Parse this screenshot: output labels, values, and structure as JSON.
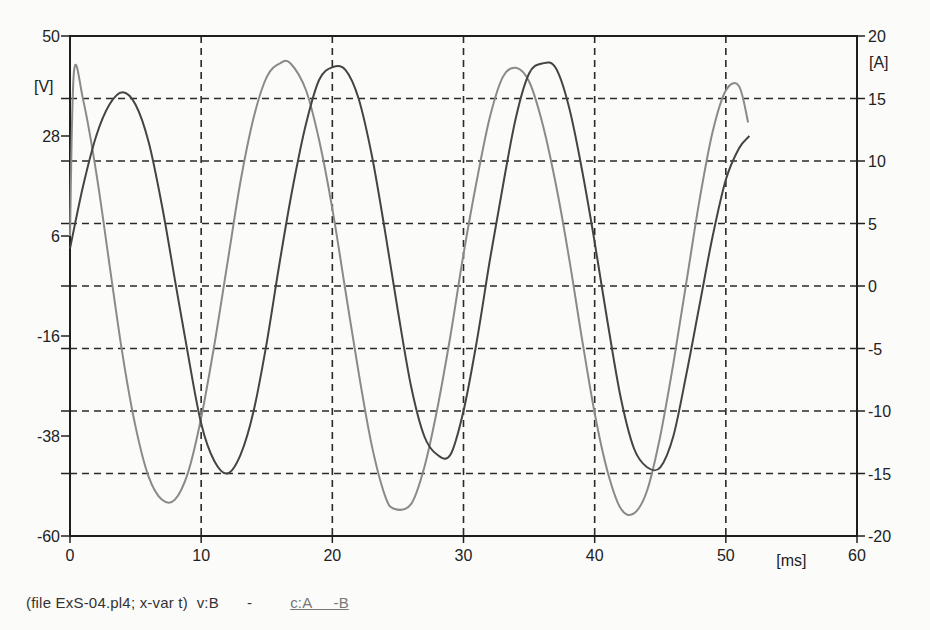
{
  "chart_data": {
    "type": "line",
    "title": "",
    "xlabel": "[ms]",
    "ylabel_left": "[V]",
    "ylabel_right": "[A]",
    "xlim": [
      0,
      60
    ],
    "ylim_left": [
      -60,
      50
    ],
    "ylim_right": [
      -20,
      20
    ],
    "x_ticks": [
      "0",
      "10",
      "20",
      "30",
      "40",
      "50",
      "60"
    ],
    "y_left_ticks": [
      "50",
      "28",
      "6",
      "-16",
      "-38",
      "-60"
    ],
    "y_right_ticks": [
      "20",
      "15",
      "10",
      "5",
      "0",
      "-5",
      "-10",
      "-15",
      "-20"
    ],
    "grid": true,
    "grid_style": "dashed",
    "series": [
      {
        "name": "v:B",
        "axis": "left",
        "color": "#8a8a8a",
        "x": [
          0.3,
          1,
          2,
          3,
          4,
          5,
          6,
          7,
          8,
          9,
          10,
          11,
          12,
          13,
          14,
          15,
          16,
          16.8,
          18,
          19,
          20,
          21,
          22,
          23,
          24,
          24.7,
          26,
          27,
          28,
          29,
          30,
          31,
          32,
          33,
          34,
          35,
          36,
          37,
          38,
          39,
          40,
          41,
          42,
          43,
          44,
          45,
          46,
          47,
          48,
          49,
          50,
          51,
          51.7
        ],
        "values": [
          42,
          36,
          20,
          0,
          -20,
          -36,
          -47,
          -52,
          -52,
          -46,
          -34,
          -18,
          0,
          18,
          32,
          41,
          44,
          44,
          38,
          27,
          12,
          -6,
          -24,
          -40,
          -51,
          -54,
          -53,
          -45,
          -32,
          -16,
          2,
          18,
          32,
          41,
          43,
          40,
          31,
          18,
          2,
          -16,
          -33,
          -46,
          -54,
          -55,
          -50,
          -38,
          -22,
          -4,
          14,
          29,
          38,
          39,
          31
        ]
      },
      {
        "name": "c:A-B",
        "axis": "right",
        "color": "#444444",
        "x": [
          0,
          1,
          2,
          3,
          4,
          5,
          6,
          7,
          8,
          9,
          10,
          11,
          12,
          13,
          14,
          15,
          16,
          17,
          18,
          19,
          20,
          21,
          22,
          23,
          24,
          25,
          26,
          27,
          28,
          29,
          30,
          31,
          32,
          33,
          34,
          35,
          36,
          37,
          38,
          39,
          40,
          41,
          42,
          43,
          44,
          45,
          46,
          47,
          48,
          49,
          50,
          51,
          51.8
        ],
        "values": [
          3,
          8,
          12,
          14.5,
          15.5,
          14.5,
          11.5,
          6.5,
          0.5,
          -5.5,
          -11,
          -14,
          -15,
          -13.5,
          -10,
          -4.5,
          2,
          8,
          13,
          16.5,
          17.5,
          17.3,
          15,
          10.5,
          4.5,
          -2,
          -8,
          -12,
          -13.5,
          -13.5,
          -10,
          -4.5,
          2,
          8,
          13.5,
          17,
          17.8,
          17.5,
          14.5,
          9.5,
          3.5,
          -3,
          -9,
          -13,
          -14.5,
          -14.5,
          -12,
          -7,
          -1.5,
          4,
          8.5,
          11,
          12
        ]
      }
    ],
    "legend": {
      "file_info": "(file ExS-04.pl4; x-var t)",
      "entries": [
        "v:B",
        "-",
        "c:A",
        "-B"
      ]
    }
  },
  "caption": {
    "file_info": "(file ExS-04.pl4; x-var t)",
    "voltage_label": "v:B",
    "dash": "-",
    "current_label": "c:A     -B"
  },
  "figure_caption": "Fig. 5.171  Comparison of ..."
}
